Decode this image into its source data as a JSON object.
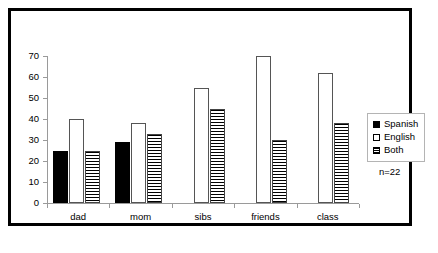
{
  "chart_data": {
    "type": "bar",
    "title": "",
    "subtitle": "",
    "xlabel": "",
    "ylabel": "",
    "categories": [
      "dad",
      "mom",
      "sibs",
      "friends",
      "class"
    ],
    "series": [
      {
        "name": "Spanish",
        "values": [
          25,
          29,
          0,
          0,
          0
        ],
        "fill": "solid-black",
        "color": "#000000"
      },
      {
        "name": "English",
        "values": [
          40,
          38,
          55,
          70,
          62
        ],
        "fill": "white",
        "color": "#ffffff"
      },
      {
        "name": "Both",
        "values": [
          25,
          33,
          45,
          30,
          38
        ],
        "fill": "horizontal-stripes",
        "color": "#ffffff"
      }
    ],
    "ylim": [
      0,
      70
    ],
    "ytick_step": 10,
    "yticks": [
      0,
      10,
      20,
      30,
      40,
      50,
      60,
      70
    ],
    "grid": false,
    "legend_position": "right",
    "annotations": [
      "n=22"
    ]
  },
  "legend": {
    "entries": [
      {
        "label": "Spanish"
      },
      {
        "label": "English"
      },
      {
        "label": "Both"
      }
    ]
  },
  "notes": {
    "sample_size": "n=22"
  }
}
